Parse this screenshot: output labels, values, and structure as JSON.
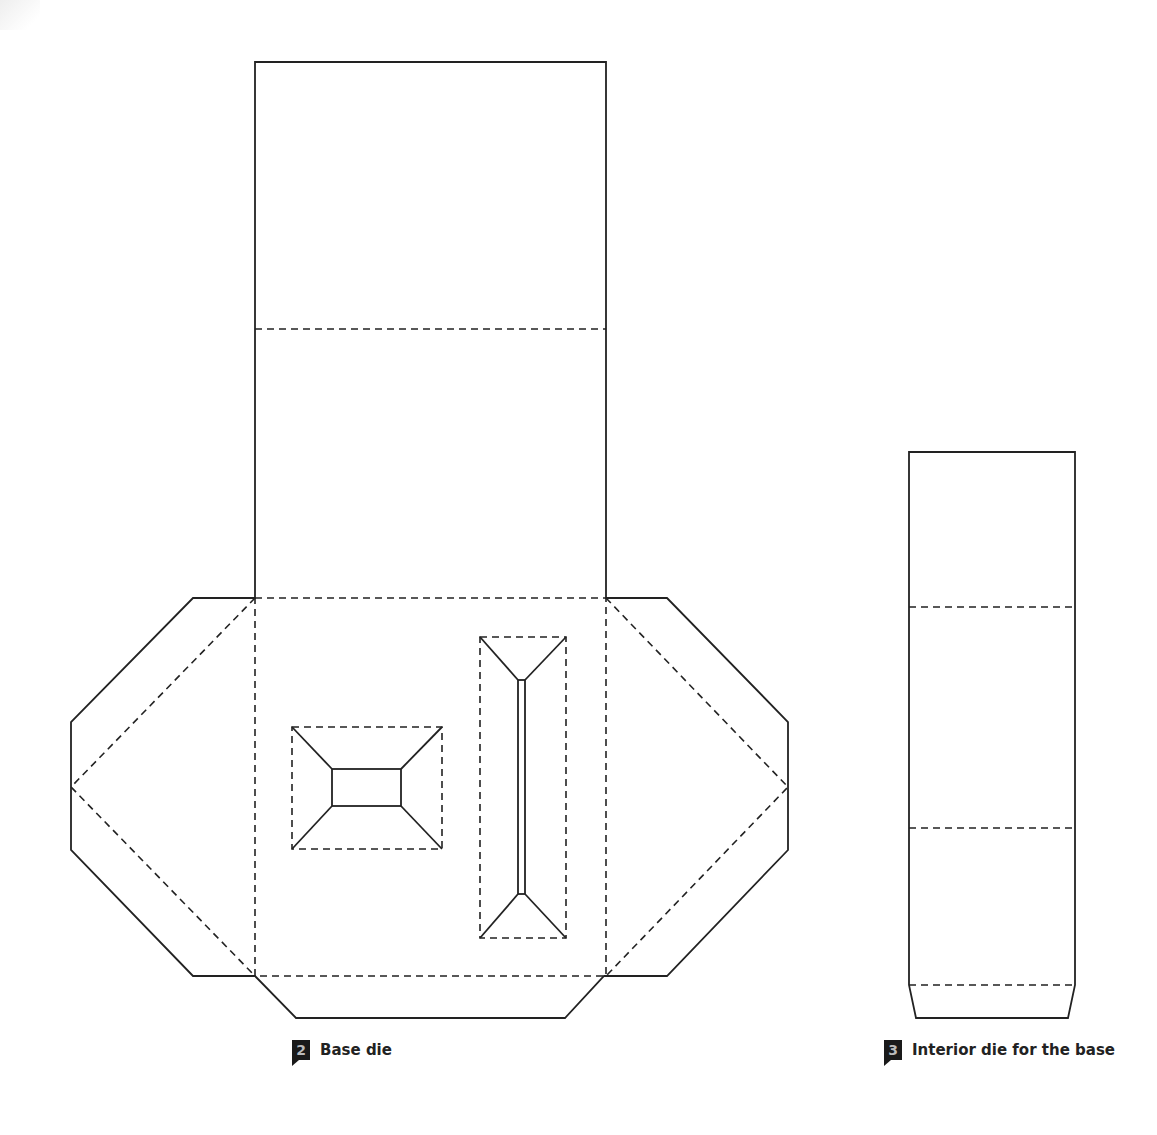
{
  "figures": [
    {
      "id": "base-die",
      "number": "2",
      "caption": "Base die"
    },
    {
      "id": "interior-die",
      "number": "3",
      "caption": "Interior die for the base"
    }
  ],
  "legend": {
    "cut_line": "solid",
    "fold_line": "dashed"
  },
  "colors": {
    "line": "#222222",
    "badge_bg": "#1a1a1a",
    "badge_text": "#bbbbbb"
  }
}
